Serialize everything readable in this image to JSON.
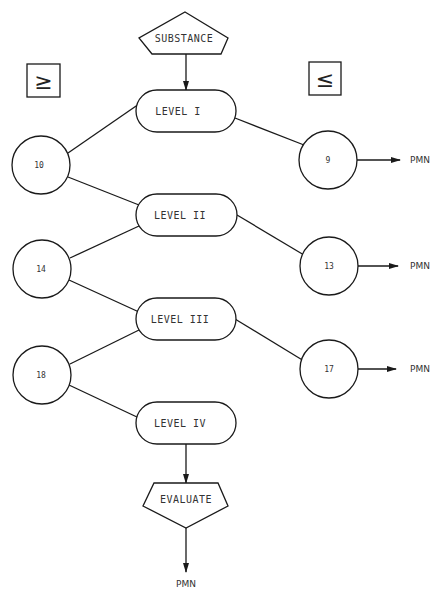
{
  "diagram": {
    "start": {
      "label": "SUBSTANCE"
    },
    "symbols": {
      "left": "≥",
      "right": "≤"
    },
    "levels": [
      {
        "label": "LEVEL I"
      },
      {
        "label": "LEVEL II"
      },
      {
        "label": "LEVEL III"
      },
      {
        "label": "LEVEL IV"
      }
    ],
    "left_nodes": [
      {
        "label": "10"
      },
      {
        "label": "14"
      },
      {
        "label": "18"
      }
    ],
    "right_nodes": [
      {
        "label": "9",
        "output": "PMN"
      },
      {
        "label": "13",
        "output": "PMN"
      },
      {
        "label": "17",
        "output": "PMN"
      }
    ],
    "end": {
      "label": "EVALUATE",
      "output": "PMN"
    }
  }
}
